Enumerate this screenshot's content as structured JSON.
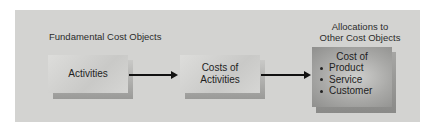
{
  "diagram": {
    "sections": {
      "fundamental_title": "Fundamental Cost Objects",
      "allocations_title_line1": "Allocations to",
      "allocations_title_line2": "Other Cost Objects"
    },
    "nodes": [
      {
        "id": "activities",
        "lines": [
          "Activities"
        ]
      },
      {
        "id": "costs-of-activities",
        "lines": [
          "Costs of",
          "Activities"
        ]
      },
      {
        "id": "cost-of",
        "heading": "Cost of",
        "bullets": [
          "Product",
          "Service",
          "Customer"
        ]
      }
    ],
    "edges": [
      {
        "from": "activities",
        "to": "costs-of-activities"
      },
      {
        "from": "costs-of-activities",
        "to": "cost-of"
      }
    ],
    "colors": {
      "panel": "#d3d3d1",
      "box_light": "#d6d6d4",
      "box_dark": "#a9a9a7",
      "arrow": "#111111"
    }
  }
}
